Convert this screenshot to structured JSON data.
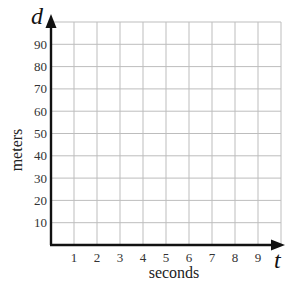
{
  "chart_data": {
    "type": "line",
    "title": "",
    "xlabel": "seconds",
    "ylabel": "meters",
    "x_variable": "t",
    "y_variable": "d",
    "xlim": [
      0,
      10
    ],
    "ylim": [
      0,
      100
    ],
    "x_ticks": [
      "1",
      "2",
      "3",
      "4",
      "5",
      "6",
      "7",
      "8",
      "9"
    ],
    "y_ticks": [
      "10",
      "20",
      "30",
      "40",
      "50",
      "60",
      "70",
      "80",
      "90"
    ],
    "grid": true,
    "grid_columns": 10,
    "grid_rows": 10,
    "series": [],
    "colors": {
      "grid": "#bdbdbd",
      "axis": "#111111",
      "text": "#333333"
    }
  },
  "labels": {
    "x_variable": "t",
    "y_variable": "d",
    "xlabel": "seconds",
    "ylabel": "meters"
  }
}
